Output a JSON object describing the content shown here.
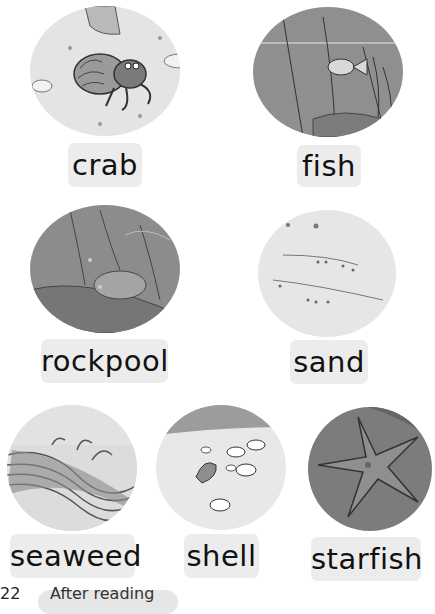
{
  "page": {
    "cards": [
      {
        "word": "crab",
        "illustration": "hermit-crab-on-sand"
      },
      {
        "word": "fish",
        "illustration": "fish-underwater"
      },
      {
        "word": "rockpool",
        "illustration": "rockpool"
      },
      {
        "word": "sand",
        "illustration": "sand"
      },
      {
        "word": "seaweed",
        "illustration": "seaweed"
      },
      {
        "word": "shell",
        "illustration": "shells-on-sand"
      },
      {
        "word": "starfish",
        "illustration": "starfish"
      }
    ],
    "footer": {
      "page_number": "22",
      "section_label": "After reading"
    }
  }
}
